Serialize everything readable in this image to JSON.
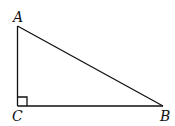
{
  "diagram": {
    "type": "right-triangle",
    "vertices": [
      {
        "id": "A",
        "label": "A"
      },
      {
        "id": "B",
        "label": "B"
      },
      {
        "id": "C",
        "label": "C"
      }
    ],
    "edges": [
      [
        "A",
        "C"
      ],
      [
        "C",
        "B"
      ],
      [
        "B",
        "A"
      ]
    ],
    "right_angle_at": "C",
    "colors": {
      "stroke": "#111111",
      "background": "#ffffff"
    }
  }
}
